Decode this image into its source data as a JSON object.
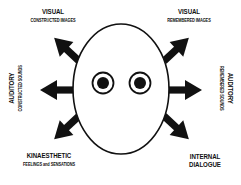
{
  "diagram": {
    "type": "eye-accessing-cues",
    "labels": {
      "visual_constructed": {
        "main": "VISUAL",
        "sub": "CONSTRUCTED IMAGES"
      },
      "visual_remembered": {
        "main": "VISUAL",
        "sub": "REMEMBERED IMAGES"
      },
      "auditory_constructed": {
        "main": "AUDITORY",
        "sub": "CONSTRUCTED SOUNDS"
      },
      "auditory_remembered": {
        "main": "AUDITORY",
        "sub": "REMEMBERED SOUNDS"
      },
      "kinaesthetic": {
        "main": "KINAESTHETIC",
        "sub": "FEELINGS and SENSATIONS"
      },
      "internal_dialogue": {
        "main": "INTERNAL DIALOGUE"
      }
    },
    "arrows": [
      {
        "direction": "up-left",
        "target": "visual_constructed"
      },
      {
        "direction": "up-right",
        "target": "visual_remembered"
      },
      {
        "direction": "left",
        "target": "auditory_constructed"
      },
      {
        "direction": "right",
        "target": "auditory_remembered"
      },
      {
        "direction": "down-left",
        "target": "kinaesthetic"
      },
      {
        "direction": "down-right",
        "target": "internal_dialogue"
      }
    ],
    "colors": {
      "ink": "#111111",
      "background": "#ffffff"
    }
  }
}
